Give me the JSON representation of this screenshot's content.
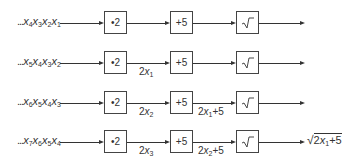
{
  "diagram": {
    "type": "pipeline",
    "stages": [
      {
        "id": "multiply",
        "label": "•2",
        "icon": "multiply-by-two"
      },
      {
        "id": "add",
        "label": "+5",
        "icon": "add-five"
      },
      {
        "id": "sqrt",
        "label": "√‾",
        "icon": "square-root-icon"
      }
    ],
    "rows": [
      {
        "input": {
          "dots": "...",
          "vars": [
            {
              "v": "x",
              "s": "4"
            },
            {
              "v": "x",
              "s": "3"
            },
            {
              "v": "x",
              "s": "2"
            },
            {
              "v": "x",
              "s": "1"
            }
          ]
        },
        "between_mult_add": "",
        "between_add_sqrt": "",
        "output": ""
      },
      {
        "input": {
          "dots": "...",
          "vars": [
            {
              "v": "x",
              "s": "5"
            },
            {
              "v": "x",
              "s": "4"
            },
            {
              "v": "x",
              "s": "3"
            },
            {
              "v": "x",
              "s": "2"
            }
          ]
        },
        "between_mult_add": {
          "pre": "2",
          "var": "x",
          "sub": "1",
          "post": ""
        },
        "between_add_sqrt": "",
        "output": ""
      },
      {
        "input": {
          "dots": "...",
          "vars": [
            {
              "v": "x",
              "s": "6"
            },
            {
              "v": "x",
              "s": "5"
            },
            {
              "v": "x",
              "s": "4"
            },
            {
              "v": "x",
              "s": "3"
            }
          ]
        },
        "between_mult_add": {
          "pre": "2",
          "var": "x",
          "sub": "2",
          "post": ""
        },
        "between_add_sqrt": {
          "pre": "2",
          "var": "x",
          "sub": "1",
          "post": "+5"
        },
        "output": ""
      },
      {
        "input": {
          "dots": "...",
          "vars": [
            {
              "v": "x",
              "s": "7"
            },
            {
              "v": "x",
              "s": "6"
            },
            {
              "v": "x",
              "s": "5"
            },
            {
              "v": "x",
              "s": "4"
            }
          ]
        },
        "between_mult_add": {
          "pre": "2",
          "var": "x",
          "sub": "3",
          "post": ""
        },
        "between_add_sqrt": {
          "pre": "2",
          "var": "x",
          "sub": "2",
          "post": "+5"
        },
        "output": {
          "pre": "2",
          "var": "x",
          "sub": "1",
          "post": "+5",
          "radical": "√"
        }
      }
    ],
    "colors": {
      "line": "#333333",
      "box_border": "#444444",
      "background": "#ffffff"
    }
  }
}
